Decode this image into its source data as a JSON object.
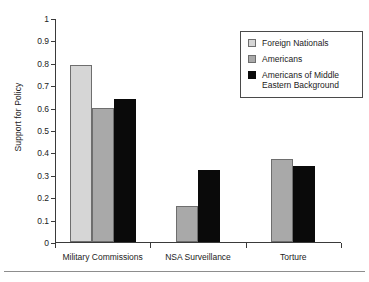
{
  "chart_data": {
    "type": "bar",
    "title": "",
    "xlabel": "",
    "ylabel": "Support for Policy",
    "ylim": [
      0,
      1
    ],
    "ytick_labels": [
      "0",
      "0.1",
      "0.2",
      "0.3",
      "0.4",
      "0.5",
      "0.6",
      "0.7",
      "0.8",
      "0.9",
      "1"
    ],
    "ytick_values": [
      0,
      0.1,
      0.2,
      0.3,
      0.4,
      0.5,
      0.6,
      0.7,
      0.8,
      0.9,
      1
    ],
    "grid": false,
    "legend_position": "upper right",
    "categories": [
      "Military Commissions",
      "NSA Surveillance",
      "Torture"
    ],
    "series": [
      {
        "name": "Foreign Nationals",
        "color": "#d6d6d6",
        "values": [
          0.79,
          null,
          null
        ]
      },
      {
        "name": "Americans",
        "color": "#a9a9a9",
        "values": [
          0.6,
          0.16,
          0.37
        ]
      },
      {
        "name": "Americans of Middle Eastern Background",
        "color": "#0a0a0a",
        "values": [
          0.64,
          0.32,
          0.34
        ]
      }
    ]
  },
  "legend": {
    "items": [
      {
        "label": "Foreign Nationals",
        "swatch": "light-gray-swatch"
      },
      {
        "label": "Americans",
        "swatch": "medium-gray-swatch"
      },
      {
        "label": "Americans of Middle Eastern Background",
        "swatch": "black-swatch"
      }
    ]
  },
  "axes": {
    "y_title": "Support for Policy"
  }
}
